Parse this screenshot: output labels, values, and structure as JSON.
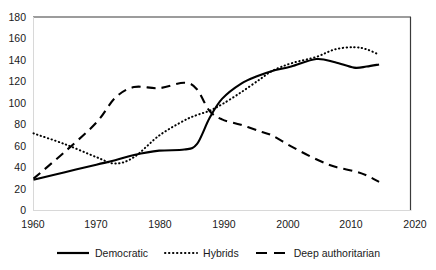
{
  "chart_data": {
    "type": "line",
    "title": "",
    "xlabel": "",
    "ylabel": "",
    "xlim": [
      1960,
      2020
    ],
    "ylim": [
      0,
      180
    ],
    "grid": false,
    "legend_position": "bottom",
    "xticks": [
      "1960",
      "1970",
      "1980",
      "1990",
      "2000",
      "2010",
      "2020"
    ],
    "yticks": [
      "0",
      "20",
      "40",
      "60",
      "80",
      "100",
      "120",
      "140",
      "160",
      "180"
    ],
    "x": [
      1960,
      1965,
      1970,
      1973,
      1976,
      1980,
      1984,
      1986,
      1988,
      1990,
      1993,
      1996,
      1998,
      2001,
      2005,
      2008,
      2011,
      2013,
      2015
    ],
    "series": [
      {
        "name": "Democratic",
        "style": "solid",
        "color": "#000000",
        "values": [
          29,
          36,
          43,
          47,
          52,
          56,
          57,
          62,
          86,
          104,
          118,
          126,
          130,
          134,
          141,
          138,
          133,
          134,
          136
        ]
      },
      {
        "name": "Hybrids",
        "style": "dotted",
        "color": "#000000",
        "values": [
          72,
          62,
          50,
          44,
          50,
          70,
          84,
          89,
          93,
          99,
          110,
          122,
          130,
          137,
          143,
          150,
          152,
          150,
          145
        ]
      },
      {
        "name": "Deep authoritarian",
        "style": "dashed",
        "color": "#000000",
        "values": [
          30,
          55,
          82,
          105,
          115,
          114,
          119,
          113,
          93,
          85,
          80,
          74,
          70,
          60,
          48,
          41,
          37,
          33,
          27
        ]
      }
    ]
  },
  "legend": {
    "items": [
      {
        "label": "Democratic",
        "swatch": "solid-line-swatch"
      },
      {
        "label": "Hybrids",
        "swatch": "dotted-line-swatch"
      },
      {
        "label": "Deep authoritarian",
        "swatch": "dashed-line-swatch"
      }
    ]
  },
  "axes": {
    "y_labels": [
      "180",
      "160",
      "140",
      "120",
      "100",
      "80",
      "60",
      "40",
      "20",
      "0"
    ],
    "x_labels": [
      "1960",
      "1970",
      "1980",
      "1990",
      "2000",
      "2010",
      "2020"
    ]
  },
  "colors": {
    "line": "#000000",
    "axis": "#3a3a3a",
    "background": "#ffffff"
  }
}
